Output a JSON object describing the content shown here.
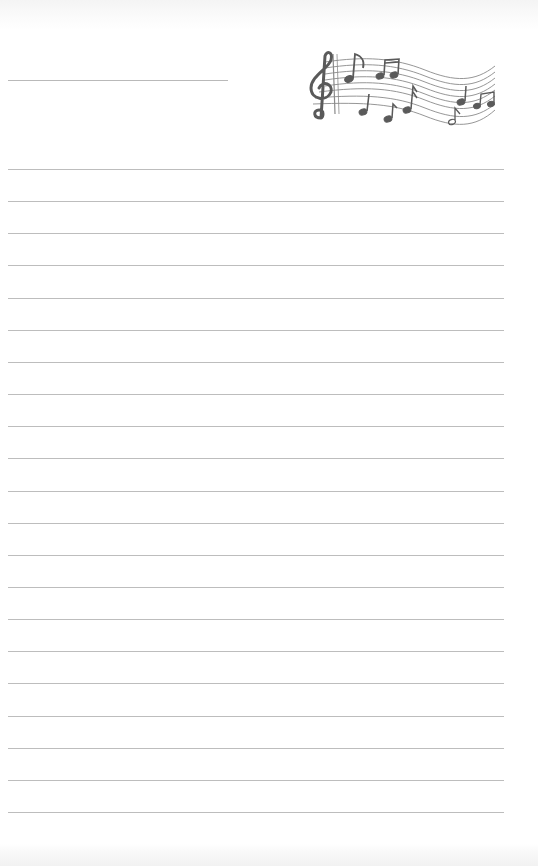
{
  "document": {
    "type": "lined-writing-paper",
    "background_color": "#ffffff",
    "line_color": "#bdbdbd",
    "title_line": {
      "x": 8,
      "y": 80,
      "width": 220
    },
    "decoration": {
      "icon": "music-staff-with-treble-clef-and-notes-icon",
      "color": "#5a5a5a"
    },
    "ruled_lines": {
      "count": 21,
      "start_y": 169,
      "spacing": 32.15,
      "x": 8,
      "width": 496
    }
  }
}
